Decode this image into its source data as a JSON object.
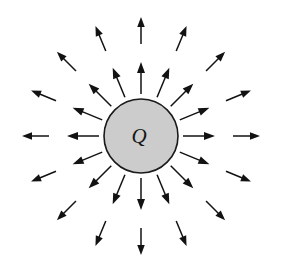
{
  "figure": {
    "name": "radial-electric-field-diagram",
    "caption": "",
    "background_color": "#ffffff",
    "width": 287,
    "height": 273
  },
  "charge": {
    "label": "Q",
    "shape": "circle",
    "center_x": 141,
    "center_y": 136,
    "radius": 37,
    "fill_color": "#cccccc",
    "stroke_color": "#1a1a1a",
    "stroke_width": 1.6,
    "label_x": 139,
    "label_y": 143,
    "label_font_size": 21
  },
  "field": {
    "description": "radial outward electric field lines",
    "arrow_color": "#121212",
    "arrow_count": 32,
    "direction_count": 16,
    "angle_step_degrees": 22.5,
    "rings": [
      {
        "name": "inner-ring",
        "start_radius": 42,
        "end_radius": 74,
        "shaft_width": 1.5,
        "head_length": 11,
        "head_width": 8
      },
      {
        "name": "outer-ring",
        "start_radius": 92,
        "end_radius": 119,
        "shaft_width": 1.5,
        "head_length": 10,
        "head_width": 7.5
      }
    ],
    "angles_degrees": [
      0,
      22.5,
      45,
      67.5,
      90,
      112.5,
      135,
      157.5,
      180,
      202.5,
      225,
      247.5,
      270,
      292.5,
      315,
      337.5
    ]
  },
  "chart_data": {
    "type": "scatter",
    "title": "",
    "xlabel": "",
    "ylabel": "",
    "series": [
      {
        "name": "inner field arrows",
        "angles_deg": [
          0,
          22.5,
          45,
          67.5,
          90,
          112.5,
          135,
          157.5,
          180,
          202.5,
          225,
          247.5,
          270,
          292.5,
          315,
          337.5
        ],
        "r_start": 42,
        "r_end": 74
      },
      {
        "name": "outer field arrows",
        "angles_deg": [
          0,
          22.5,
          45,
          67.5,
          90,
          112.5,
          135,
          157.5,
          180,
          202.5,
          225,
          247.5,
          270,
          292.5,
          315,
          337.5
        ],
        "r_start": 92,
        "r_end": 119
      }
    ],
    "annotations": [
      "Q"
    ]
  }
}
